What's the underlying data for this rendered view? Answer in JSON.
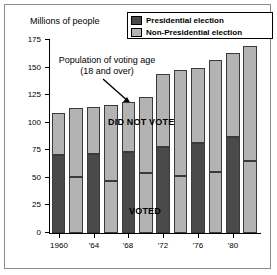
{
  "axis_title": "Millions of people",
  "legend": {
    "items": [
      {
        "label": "Presidential election",
        "color": "#4a4a4a",
        "swatch": "dark"
      },
      {
        "label": "Non-Presidential election",
        "color": "#b3b3b3",
        "swatch": "light"
      }
    ]
  },
  "annotations": {
    "population_note_line1": "Population of voting age",
    "population_note_line2": "(18 and over)",
    "did_not_vote": "DID NOT VOTE",
    "voted": "VOTED"
  },
  "colors": {
    "presidential": "#4a4a4a",
    "non_presidential": "#b3b3b3",
    "outline": "#3a3a3a",
    "axis": "#000000",
    "frame": "#8a8a8a"
  },
  "chart_data": {
    "type": "bar",
    "title": "",
    "subtitle": "",
    "xlabel": "",
    "ylabel": "Millions of people",
    "ylim": [
      0,
      175
    ],
    "yticks": [
      0,
      25,
      50,
      75,
      100,
      125,
      150,
      175
    ],
    "ytick_labels": [
      "0",
      "25",
      "50",
      "75",
      "100",
      "125",
      "150",
      "175"
    ],
    "grid": false,
    "legend_position": "top-right",
    "stacked": true,
    "categories": [
      "1960",
      "1962",
      "1964",
      "1966",
      "1968",
      "1970",
      "1972",
      "1974",
      "1976",
      "1978",
      "1980",
      "1982"
    ],
    "xtick_labels": [
      "1960",
      "'64",
      "'68",
      "'72",
      "'76",
      "'80"
    ],
    "xtick_categories": [
      "1960",
      "1964",
      "1968",
      "1972",
      "1976",
      "1980"
    ],
    "election_type": [
      "presidential",
      "non-presidential",
      "presidential",
      "non-presidential",
      "presidential",
      "non-presidential",
      "presidential",
      "non-presidential",
      "presidential",
      "non-presidential",
      "presidential",
      "non-presidential"
    ],
    "series": [
      {
        "name": "Voted",
        "values": [
          71,
          51,
          72,
          47,
          73,
          54,
          78,
          52,
          82,
          55,
          87,
          65
        ]
      },
      {
        "name": "Did not vote",
        "values": [
          38,
          62,
          42,
          69,
          46,
          69,
          66,
          96,
          68,
          102,
          76,
          105
        ]
      }
    ],
    "totals": {
      "name": "Population of voting age (18 and over)",
      "values": [
        109,
        113,
        114,
        116,
        119,
        123,
        144,
        148,
        150,
        157,
        163,
        170
      ]
    }
  }
}
